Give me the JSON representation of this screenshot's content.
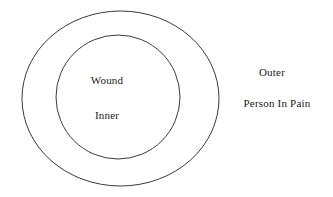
{
  "diagram": {
    "type": "concentric-circles",
    "background_color": "#ffffff",
    "stroke_color": "#3a3a3a",
    "text_color": "#1a1a1a",
    "shapes": [
      {
        "name": "outer-ellipse",
        "shape": "ellipse",
        "cx": 120.5,
        "cy": 98.5,
        "rx": 98.5,
        "ry": 87.5,
        "stroke": "#3a3a3a",
        "stroke_width": 1,
        "fill": "none"
      },
      {
        "name": "inner-circle",
        "shape": "circle",
        "cx": 118,
        "cy": 97,
        "r": 62,
        "stroke": "#3a3a3a",
        "stroke_width": 1,
        "fill": "none"
      }
    ],
    "labels": {
      "wound": "Wound",
      "inner": "Inner",
      "outer": "Outer",
      "person_in_pain": "Person In Pain"
    }
  }
}
